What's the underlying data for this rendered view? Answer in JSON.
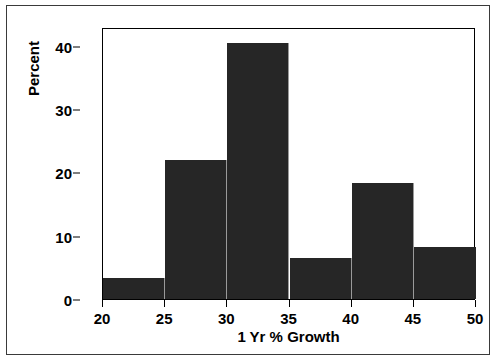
{
  "chart_data": {
    "type": "bar",
    "title": "",
    "xlabel": "1 Yr % Growth",
    "ylabel": "Percent",
    "categories": [
      "20-25",
      "25-30",
      "30-35",
      "35-40",
      "40-45",
      "45-50"
    ],
    "bin_edges": [
      20,
      25,
      30,
      35,
      40,
      45,
      50
    ],
    "values": [
      3.3,
      22.0,
      40.5,
      6.5,
      18.3,
      8.2
    ],
    "xlim": [
      20,
      50
    ],
    "ylim": [
      0,
      43
    ],
    "x_ticks": [
      20,
      25,
      30,
      35,
      40,
      45,
      50
    ],
    "y_ticks": [
      0,
      10,
      20,
      30,
      40
    ],
    "grid": false,
    "legend": null,
    "bar_color": "#262626",
    "bar_edge_color": "#9a9a9a",
    "axis_color": "#000000",
    "frame_color": "#3a3a3a",
    "background": "#ffffff"
  }
}
